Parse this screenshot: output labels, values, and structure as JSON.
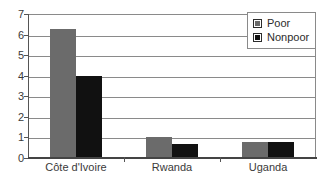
{
  "chart_data": {
    "type": "bar",
    "title": "",
    "xlabel": "",
    "ylabel": "",
    "ylim": [
      0,
      7
    ],
    "ytick_step": 1,
    "ytick_labels": [
      "7",
      "6",
      "5",
      "4",
      "3",
      "2",
      "1",
      "0"
    ],
    "grid": true,
    "legend_position": "top-right",
    "categories": [
      "Côte d'Ivoire",
      "Rwanda",
      "Uganda"
    ],
    "series": [
      {
        "name": "Poor",
        "color": "#6b6b6b",
        "values": [
          6.25,
          1.0,
          0.8
        ]
      },
      {
        "name": "Nonpoor",
        "color": "#111111",
        "values": [
          4.0,
          0.7,
          0.8
        ]
      }
    ]
  },
  "legend": {
    "items": [
      {
        "label": "Poor"
      },
      {
        "label": "Nonpoor"
      }
    ]
  },
  "colors": {
    "poor": "#6b6b6b",
    "nonpoor": "#111111",
    "gridline": "#8a8a8a",
    "axis": "#555555",
    "text": "#3a3a3a",
    "background": "#ffffff"
  }
}
